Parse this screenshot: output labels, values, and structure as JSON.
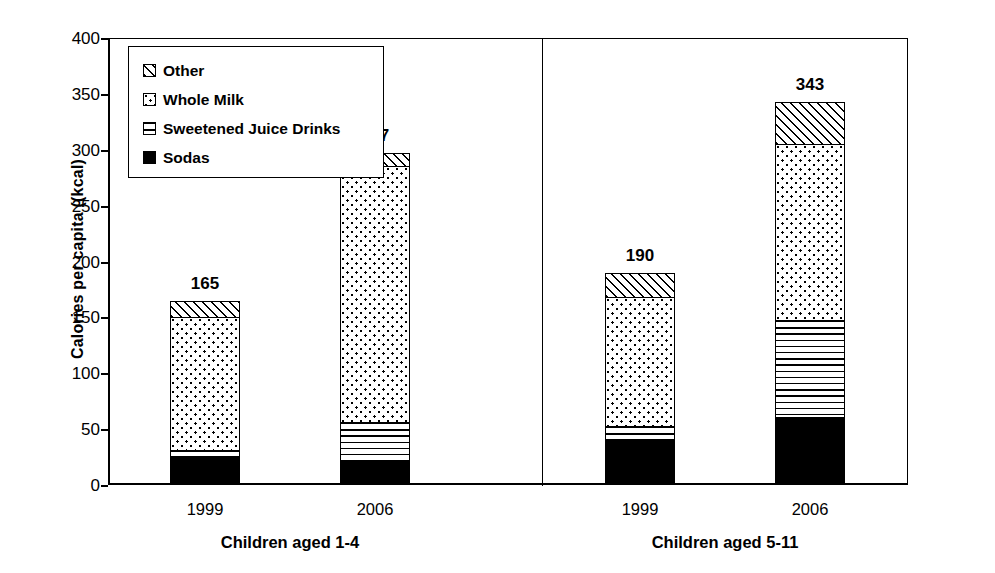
{
  "chart_data": {
    "type": "bar",
    "subtype": "stacked-bar",
    "title": "",
    "xlabel": "",
    "ylabel": "Calories per capita ((kcal)",
    "ylim": [
      0,
      400
    ],
    "ytick_step": 50,
    "yticks": [
      "400",
      "350",
      "300",
      "250",
      "200",
      "150",
      "100",
      "50",
      "0"
    ],
    "grid": false,
    "legend_position": "upper-left-inside",
    "legend_entries": [
      {
        "label": "Other",
        "pattern": "diagonal-hatch"
      },
      {
        "label": "Whole Milk",
        "pattern": "dotted"
      },
      {
        "label": "Sweetened Juice Drinks",
        "pattern": "horizontal-lines"
      },
      {
        "label": "Sodas",
        "pattern": "solid-black"
      }
    ],
    "series": [
      {
        "name": "Sodas",
        "pattern": "solid-black",
        "values": [
          25,
          20,
          40,
          60
        ]
      },
      {
        "name": "Sweetened Juice Drinks",
        "pattern": "horizontal-lines",
        "values": [
          6,
          36,
          12,
          87
        ]
      },
      {
        "name": "Whole Milk",
        "pattern": "dotted",
        "values": [
          119,
          229,
          116,
          158
        ]
      },
      {
        "name": "Other",
        "pattern": "diagonal-hatch",
        "values": [
          15,
          12,
          22,
          38
        ]
      }
    ],
    "groups": [
      {
        "label": "Children aged 1-4",
        "categories": [
          "1999",
          "2006"
        ],
        "totals": [
          165,
          297
        ]
      },
      {
        "label": "Children aged 5-11",
        "categories": [
          "1999",
          "2006"
        ],
        "totals": [
          190,
          343
        ]
      }
    ],
    "bars": [
      {
        "group": "Children aged 1-4",
        "category": "1999",
        "total_label": "165",
        "segments": [
          {
            "name": "Sodas",
            "value": 25
          },
          {
            "name": "Sweetened Juice Drinks",
            "value": 6
          },
          {
            "name": "Whole Milk",
            "value": 119
          },
          {
            "name": "Other",
            "value": 15
          }
        ]
      },
      {
        "group": "Children aged 1-4",
        "category": "2006",
        "total_label": "297",
        "segments": [
          {
            "name": "Sodas",
            "value": 20
          },
          {
            "name": "Sweetened Juice Drinks",
            "value": 36
          },
          {
            "name": "Whole Milk",
            "value": 229
          },
          {
            "name": "Other",
            "value": 12
          }
        ]
      },
      {
        "group": "Children aged 5-11",
        "category": "1999",
        "total_label": "190",
        "segments": [
          {
            "name": "Sodas",
            "value": 40
          },
          {
            "name": "Sweetened Juice Drinks",
            "value": 12
          },
          {
            "name": "Whole Milk",
            "value": 116
          },
          {
            "name": "Other",
            "value": 22
          }
        ]
      },
      {
        "group": "Children aged 5-11",
        "category": "2006",
        "total_label": "343",
        "segments": [
          {
            "name": "Sodas",
            "value": 60
          },
          {
            "name": "Sweetened Juice Drinks",
            "value": 87
          },
          {
            "name": "Whole Milk",
            "value": 158
          },
          {
            "name": "Other",
            "value": 38
          }
        ]
      }
    ],
    "colors": {
      "ink": "#000000",
      "background": "#ffffff"
    }
  }
}
